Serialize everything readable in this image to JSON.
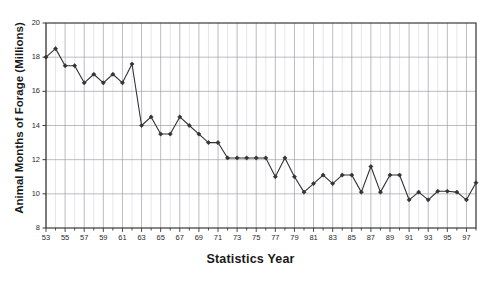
{
  "chart_data": {
    "type": "line",
    "title": "",
    "xlabel": "Statistics Year",
    "ylabel": "Animal Months of Forage (Millions)",
    "ylim": [
      8,
      20
    ],
    "xlim": [
      53,
      98
    ],
    "yticks": [
      8,
      10,
      12,
      14,
      16,
      18,
      20
    ],
    "ytick_labels": [
      "8",
      "10",
      "12",
      "14",
      "16",
      "18",
      "20"
    ],
    "xticks": [
      53,
      55,
      57,
      59,
      61,
      63,
      65,
      67,
      69,
      71,
      73,
      75,
      77,
      79,
      81,
      83,
      85,
      87,
      89,
      91,
      93,
      95,
      97
    ],
    "xtick_labels": [
      "53",
      "55",
      "57",
      "59",
      "61",
      "63",
      "65",
      "67",
      "69",
      "71",
      "73",
      "75",
      "77",
      "79",
      "81",
      "83",
      "85",
      "87",
      "89",
      "91",
      "93",
      "95",
      "97"
    ],
    "grid": "vertical-minor-every-year-and-horizontal-major",
    "legend": "none",
    "marker": "filled-diamond",
    "line_color": "#333333",
    "grid_color": "#9a9aa8",
    "axis_color": "#3a3a3a",
    "x": [
      53,
      54,
      55,
      56,
      57,
      58,
      59,
      60,
      61,
      62,
      63,
      64,
      65,
      66,
      67,
      68,
      69,
      70,
      71,
      72,
      73,
      74,
      75,
      76,
      77,
      78,
      79,
      80,
      81,
      82,
      83,
      84,
      85,
      86,
      87,
      88,
      89,
      90,
      91,
      92,
      93,
      94,
      95,
      96,
      97,
      98
    ],
    "values": [
      18.0,
      18.5,
      17.5,
      17.5,
      16.5,
      17.0,
      16.5,
      17.0,
      16.5,
      17.6,
      14.0,
      14.5,
      13.5,
      13.5,
      14.5,
      14.0,
      13.5,
      13.0,
      13.0,
      12.1,
      12.1,
      12.1,
      12.1,
      12.1,
      11.0,
      12.1,
      11.0,
      10.1,
      10.6,
      11.1,
      10.6,
      11.1,
      11.1,
      10.1,
      11.6,
      10.1,
      11.1,
      11.1,
      9.65,
      10.1,
      9.65,
      10.15,
      10.15,
      10.1,
      9.65,
      10.65
    ],
    "series": [
      {
        "name": "Animal Months of Forage",
        "values": [
          18.0,
          18.5,
          17.5,
          17.5,
          16.5,
          17.0,
          16.5,
          17.0,
          16.5,
          17.6,
          14.0,
          14.5,
          13.5,
          13.5,
          14.5,
          14.0,
          13.5,
          13.0,
          13.0,
          12.1,
          12.1,
          12.1,
          12.1,
          12.1,
          11.0,
          12.1,
          11.0,
          10.1,
          10.6,
          11.1,
          10.6,
          11.1,
          11.1,
          10.1,
          11.6,
          10.1,
          11.1,
          11.1,
          9.65,
          10.1,
          9.65,
          10.15,
          10.15,
          10.1,
          9.65,
          10.65
        ]
      }
    ]
  }
}
